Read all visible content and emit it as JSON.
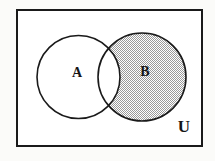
{
  "figure": {
    "background_color": "#fbfbf9",
    "line_color": "#1a1a1a",
    "fill_white": "#ffffff",
    "shade_color": "#c9c9c9",
    "shade_pattern": "checkerboard-dither"
  },
  "universe": {
    "label": "U",
    "label_x": 184,
    "label_y": 128,
    "rect": {
      "x": 17,
      "y": 10,
      "width": 185,
      "height": 136
    },
    "stroke_width": 2
  },
  "sets": [
    {
      "name": "set-a",
      "label": "A",
      "cx": 78.5,
      "cy": 77,
      "r": 41.5,
      "label_x": 77,
      "label_y": 74,
      "shaded": false
    },
    {
      "name": "set-b",
      "label": "B",
      "cx": 142,
      "cy": 77,
      "r": 44,
      "label_x": 145,
      "label_y": 73,
      "shaded": true
    }
  ],
  "regions": {
    "intersection_shaded": false,
    "a_only_shaded": false,
    "b_only_shaded": true,
    "outside_shaded": false
  }
}
